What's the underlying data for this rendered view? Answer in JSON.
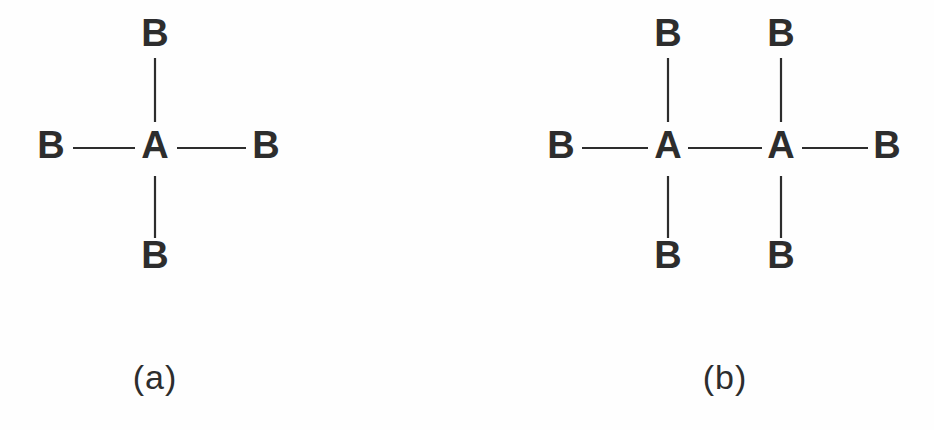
{
  "figure": {
    "background_color": "#fefefe",
    "stroke_color": "#2d2d2d",
    "atom_font_size": 38,
    "caption_font_size": 34,
    "bond_stroke_width": 2.2
  },
  "chart_data": {
    "type": "diagram",
    "subtype": "chemical-structure",
    "title": "",
    "panels": [
      {
        "id": "a",
        "caption": "(a)",
        "caption_x": 155,
        "caption_y": 380,
        "atom_counts": {
          "A": 1,
          "B": 4
        },
        "formula": "AB4",
        "atoms": [
          {
            "id": "a-center-A",
            "label": "A",
            "x": 155,
            "y": 148,
            "role": "central"
          },
          {
            "id": "a-top-B",
            "label": "B",
            "x": 155,
            "y": 36,
            "role": "terminal"
          },
          {
            "id": "a-left-B",
            "label": "B",
            "x": 51,
            "y": 148,
            "role": "terminal"
          },
          {
            "id": "a-right-B",
            "label": "B",
            "x": 266,
            "y": 148,
            "role": "terminal"
          },
          {
            "id": "a-bottom-B",
            "label": "B",
            "x": 155,
            "y": 258,
            "role": "terminal"
          }
        ],
        "bonds": [
          {
            "id": "a-bond-top",
            "from": "a-center-A",
            "to": "a-top-B",
            "orientation": "vertical",
            "x1": 155,
            "y1": 58,
            "x2": 155,
            "y2": 122
          },
          {
            "id": "a-bond-left",
            "from": "a-left-B",
            "to": "a-center-A",
            "orientation": "horizontal",
            "x1": 73,
            "y1": 148,
            "x2": 135,
            "y2": 148
          },
          {
            "id": "a-bond-right",
            "from": "a-center-A",
            "to": "a-right-B",
            "orientation": "horizontal",
            "x1": 177,
            "y1": 148,
            "x2": 246,
            "y2": 148
          },
          {
            "id": "a-bond-bottom",
            "from": "a-center-A",
            "to": "a-bottom-B",
            "orientation": "vertical",
            "x1": 155,
            "y1": 176,
            "x2": 155,
            "y2": 238
          }
        ]
      },
      {
        "id": "b",
        "caption": "(b)",
        "caption_x": 725,
        "caption_y": 380,
        "atom_counts": {
          "A": 2,
          "B": 6
        },
        "formula": "A2B6",
        "atoms": [
          {
            "id": "b-left-A",
            "label": "A",
            "x": 668,
            "y": 148,
            "role": "central"
          },
          {
            "id": "b-right-A",
            "label": "A",
            "x": 781,
            "y": 148,
            "role": "central"
          },
          {
            "id": "b-top-left-B",
            "label": "B",
            "x": 668,
            "y": 36,
            "role": "terminal"
          },
          {
            "id": "b-top-right-B",
            "label": "B",
            "x": 781,
            "y": 36,
            "role": "terminal"
          },
          {
            "id": "b-far-left-B",
            "label": "B",
            "x": 561,
            "y": 148,
            "role": "terminal"
          },
          {
            "id": "b-far-right-B",
            "label": "B",
            "x": 887,
            "y": 148,
            "role": "terminal"
          },
          {
            "id": "b-bottom-left-B",
            "label": "B",
            "x": 668,
            "y": 258,
            "role": "terminal"
          },
          {
            "id": "b-bottom-right-B",
            "label": "B",
            "x": 781,
            "y": 258,
            "role": "terminal"
          }
        ],
        "bonds": [
          {
            "id": "b-bond-top-left",
            "from": "b-left-A",
            "to": "b-top-left-B",
            "orientation": "vertical",
            "x1": 668,
            "y1": 58,
            "x2": 668,
            "y2": 122
          },
          {
            "id": "b-bond-top-right",
            "from": "b-right-A",
            "to": "b-top-right-B",
            "orientation": "vertical",
            "x1": 781,
            "y1": 58,
            "x2": 781,
            "y2": 122
          },
          {
            "id": "b-bond-far-left",
            "from": "b-far-left-B",
            "to": "b-left-A",
            "orientation": "horizontal",
            "x1": 582,
            "y1": 148,
            "x2": 648,
            "y2": 148
          },
          {
            "id": "b-bond-center",
            "from": "b-left-A",
            "to": "b-right-A",
            "orientation": "horizontal",
            "x1": 688,
            "y1": 148,
            "x2": 762,
            "y2": 148
          },
          {
            "id": "b-bond-far-right",
            "from": "b-right-A",
            "to": "b-far-right-B",
            "orientation": "horizontal",
            "x1": 802,
            "y1": 148,
            "x2": 868,
            "y2": 148
          },
          {
            "id": "b-bond-bottom-left",
            "from": "b-left-A",
            "to": "b-bottom-left-B",
            "orientation": "vertical",
            "x1": 668,
            "y1": 176,
            "x2": 668,
            "y2": 238
          },
          {
            "id": "b-bond-bottom-right",
            "from": "b-right-A",
            "to": "b-bottom-right-B",
            "orientation": "vertical",
            "x1": 781,
            "y1": 176,
            "x2": 781,
            "y2": 238
          }
        ]
      }
    ]
  }
}
